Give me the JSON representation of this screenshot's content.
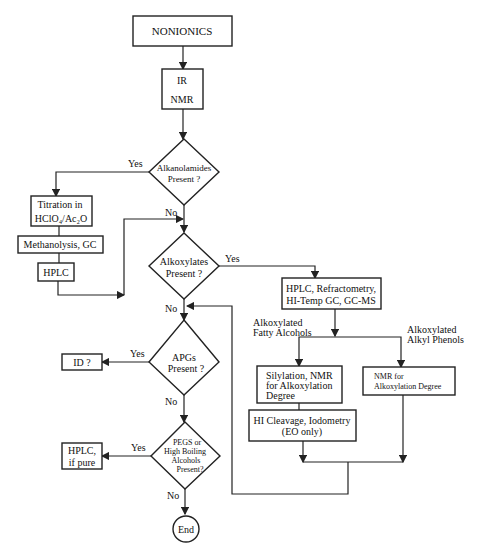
{
  "nodes": {
    "nonionics": "NONIONICS",
    "ir": "IR",
    "nmr": "NMR",
    "alkanolamides": [
      "Alkanolamides",
      "Present ?"
    ],
    "titration": [
      "Titration in",
      "HClO₄/Ac₂O"
    ],
    "methanolysis": "Methanolysis, GC",
    "hplc_left": "HPLC",
    "alkoxylates": [
      "Alkoxylates",
      "Present ?"
    ],
    "hplc_refract": [
      "HPLC, Refractometry,",
      "HI-Temp GC, GC-MS"
    ],
    "fatty_label": [
      "Alkoxylated",
      "Fatty Alcohols"
    ],
    "phenol_label": [
      "Alkoxylated",
      "Alkyl Phenols"
    ],
    "silylation": [
      "Silylation, NMR",
      "for Alkoxylation",
      "Degree"
    ],
    "hi_cleavage": [
      "HI Cleavage, Iodometry",
      "(EO only)"
    ],
    "nmr_degree": [
      "NMR for",
      "Alkoxylation Degree"
    ],
    "apgs": [
      "APGs",
      "Present ?"
    ],
    "id": "ID ?",
    "pegs": [
      "PEGS or",
      "High Boiling",
      "Alcohols",
      "Present?"
    ],
    "hplc_pure": [
      "HPLC,",
      "if pure"
    ],
    "end": "End"
  },
  "edges": {
    "yes": "Yes",
    "no": "No"
  }
}
